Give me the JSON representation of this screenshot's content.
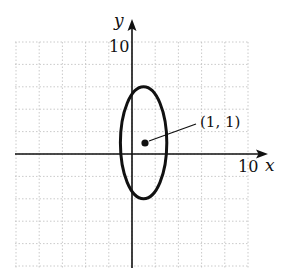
{
  "chart_data": {
    "type": "scatter",
    "title": "",
    "xlabel": "x",
    "ylabel": "y",
    "xlim": [
      -10,
      10
    ],
    "ylim": [
      -10,
      10
    ],
    "grid": true,
    "grid_step": 2,
    "tick_labels": {
      "x": [
        "10"
      ],
      "y": [
        "10"
      ]
    },
    "series": [
      {
        "name": "ellipse",
        "shape": "ellipse",
        "center": [
          1,
          1
        ],
        "semi_axis_x": 2,
        "semi_axis_y": 5,
        "equation": "(x-1)^2/4 + (y-1)^2/25 = 1"
      },
      {
        "name": "center-point",
        "points": [
          [
            1,
            1
          ]
        ]
      }
    ],
    "annotations": [
      {
        "text": "(1, 1)",
        "target": [
          1,
          1
        ]
      }
    ],
    "colors": {
      "curve": "#111111",
      "grid": "#bdbdbd"
    }
  },
  "labels": {
    "x_axis": "x",
    "y_axis": "y",
    "x_tick": "10",
    "y_tick": "10",
    "point": "(1, 1)"
  }
}
